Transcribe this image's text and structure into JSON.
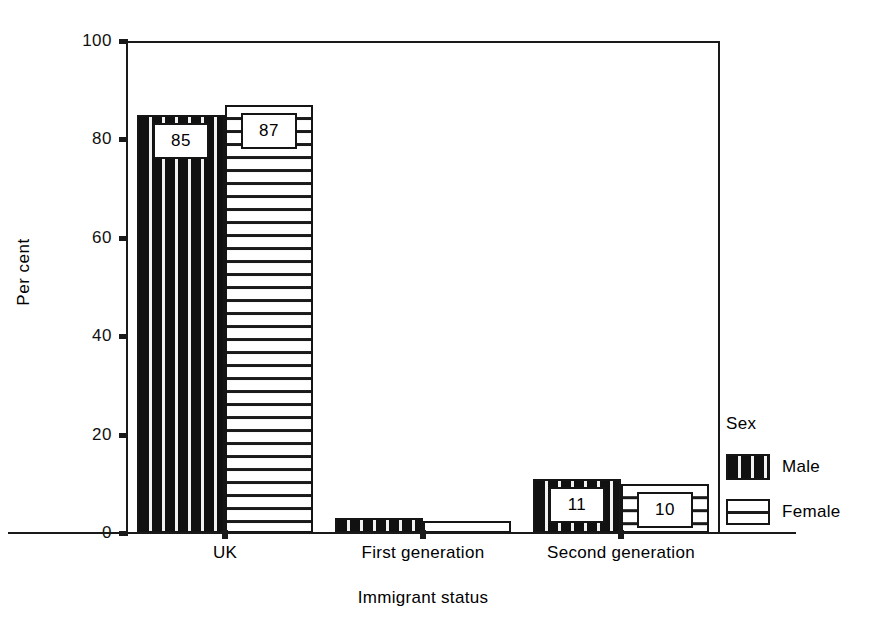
{
  "chart_data": {
    "type": "bar",
    "title": "",
    "subtitle": "",
    "xlabel": "Immigrant status",
    "ylabel": "Per cent",
    "categories": [
      "UK",
      "First generation",
      "Second generation"
    ],
    "series": [
      {
        "name": "Male",
        "values": [
          85,
          3,
          11
        ],
        "labels": [
          "85",
          "",
          "11"
        ],
        "swatch": "black-vertical-stripes"
      },
      {
        "name": "Female",
        "values": [
          87,
          2.5,
          10
        ],
        "labels": [
          "87",
          "",
          "10"
        ],
        "swatch": "white-horizontal-lines"
      }
    ],
    "ylim": [
      0,
      100
    ],
    "yticks": [
      0,
      20,
      40,
      60,
      80,
      100
    ],
    "ytick_labels": [
      "0",
      "20",
      "40",
      "60",
      "80",
      "100"
    ],
    "grid": false,
    "legend": {
      "title": "Sex",
      "position": "right",
      "entries": [
        "Male",
        "Female"
      ]
    },
    "colors": {
      "ink": "#151515",
      "male_fill": "#111111",
      "female_fill": "#ffffff",
      "background": "#ffffff"
    }
  }
}
